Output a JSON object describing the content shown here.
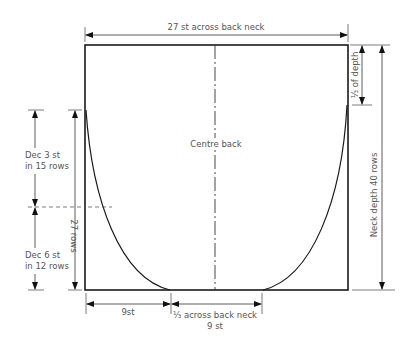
{
  "diagram": {
    "type": "knitting-schematic-back-neck",
    "labels": {
      "top_width": "27 st across back neck",
      "centre": "Centre back",
      "third_depth": "⅓ of depth",
      "neck_depth": "Neck depth 40 rows",
      "dec_upper_line1": "Dec 3 st",
      "dec_upper_line2": "in 15 rows",
      "dec_lower_line1": "Dec 6 st",
      "dec_lower_line2": "in 12 rows",
      "rows_27": "27 rows",
      "bottom_left": "9st",
      "bottom_centre_line1": "⅓ across back neck",
      "bottom_centre_line2": "9 st"
    },
    "colors": {
      "outline": "#1a1a1a",
      "dimension": "#333333",
      "text": "#555555"
    }
  }
}
